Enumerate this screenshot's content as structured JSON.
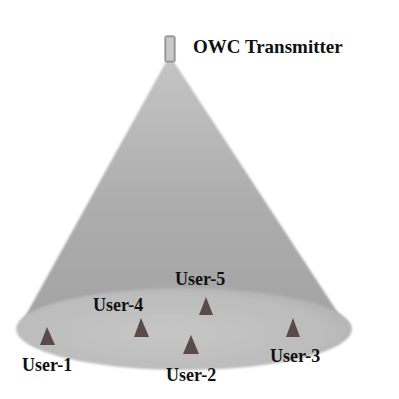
{
  "diagram": {
    "type": "owc-coverage-cone",
    "transmitter": {
      "label": "OWC Transmitter",
      "icon": "transmitter-box-icon"
    },
    "coverage_area": {
      "shape": "ellipse",
      "cone_color": "#a9a9a9",
      "floor_color": "#c4c4c4"
    },
    "user_marker": {
      "icon": "triangle-user-icon",
      "color": "#5a4a4a"
    },
    "users": [
      {
        "label": "User-1"
      },
      {
        "label": "User-2"
      },
      {
        "label": "User-3"
      },
      {
        "label": "User-4"
      },
      {
        "label": "User-5"
      }
    ]
  }
}
